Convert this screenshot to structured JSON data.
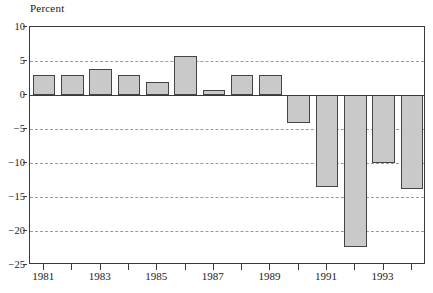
{
  "chart_data": {
    "type": "bar",
    "title": "",
    "ylabel": "Percent",
    "xlabel": "",
    "ylim": [
      -25,
      10
    ],
    "ytick_values": [
      10,
      5,
      0,
      -5,
      -10,
      -15,
      -20,
      -25
    ],
    "ytick_labels": [
      "10",
      "5",
      "0",
      "−5",
      "−10",
      "−15",
      "−20",
      "−25"
    ],
    "grid": true,
    "grid_style": "dashed horizontal",
    "legend": "none",
    "categories": [
      1981,
      1982,
      1983,
      1984,
      1985,
      1986,
      1987,
      1988,
      1989,
      1990,
      1991,
      1992,
      1993,
      1994
    ],
    "xtick_labels_shown": [
      "1981",
      "1983",
      "1985",
      "1987",
      "1989",
      "1991",
      "1993"
    ],
    "values": [
      3.0,
      3.0,
      3.8,
      3.0,
      1.9,
      5.8,
      0.8,
      3.0,
      3.0,
      -4.1,
      -13.5,
      -22.4,
      -10.0,
      -13.8
    ],
    "bar_fill_color": "#c9c9c9",
    "bar_edge_color": "#444444",
    "axis_color": "#3a3a3a",
    "grid_color": "#9a9a9a",
    "background_color": "#ffffff"
  }
}
